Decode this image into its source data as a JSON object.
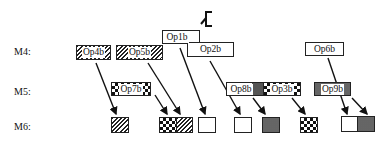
{
  "diagram": {
    "row_labels": {
      "m4": "M4:",
      "m5": "M5:",
      "m6": "M6:"
    },
    "ops": {
      "op1b": "Op1b",
      "op2b": "Op2b",
      "op3b": "Op3b",
      "op4b": "Op4b",
      "op5b": "Op5b",
      "op6b": "Op6b",
      "op7b": "Op7b",
      "op8b": "Op8b",
      "op9b": "Op9b"
    },
    "patterns": {
      "op4b": "hatched",
      "op5b": "hatched",
      "op7b": "checkered",
      "op8b": "dark-gray",
      "op3b": "checkered",
      "op9b": "dark-gray",
      "op1b": "white",
      "op2b": "white",
      "op6b": "white"
    },
    "m6_blocks": [
      {
        "pattern": "hatched"
      },
      {
        "pattern": "checkered+hatched"
      },
      {
        "pattern": "white"
      },
      {
        "pattern": "white"
      },
      {
        "pattern": "dark-gray"
      },
      {
        "pattern": "checkered"
      },
      {
        "pattern": "white+dark-gray"
      }
    ],
    "colors": {
      "stroke": "#222222",
      "gray": "#555555",
      "background": "#ffffff"
    }
  }
}
